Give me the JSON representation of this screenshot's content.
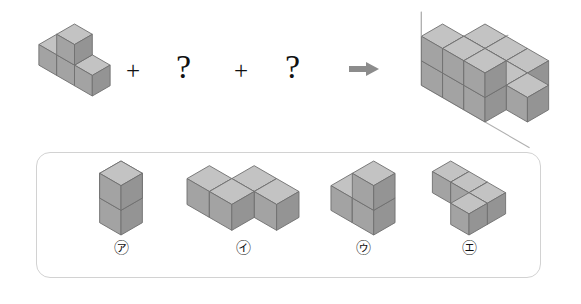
{
  "equation": {
    "operators": [
      {
        "id": "plus-1",
        "symbol": "+"
      },
      {
        "id": "question-1",
        "symbol": "?"
      },
      {
        "id": "plus-2",
        "symbol": "+"
      },
      {
        "id": "question-2",
        "symbol": "?"
      },
      {
        "id": "arrow",
        "symbol": "⇒"
      }
    ],
    "given_figure_name": "given-solid",
    "result_figure_name": "result-solid"
  },
  "options": [
    {
      "key": "ga",
      "label": "㆚e",
      "label_text": "㋐",
      "cube_count": 3,
      "shape": "L-tromino-upright"
    },
    {
      "key": "na",
      "label": "㋑",
      "label_text": "㋑",
      "cube_count": 4,
      "shape": "S-tetromino-flat"
    },
    {
      "key": "da",
      "label": "㋒",
      "label_text": "㋒",
      "cube_count": 3,
      "shape": "L-tromino-stacked"
    },
    {
      "key": "ra",
      "label": "㋓",
      "label_text": "㋓",
      "cube_count": 4,
      "shape": "L-tetromino-flat"
    }
  ],
  "option_labels": {
    "ga": "㋐",
    "na": "㋑",
    "da": "㋒",
    "ra": "㋓"
  },
  "colors": {
    "cube_top": "#c3c3c3",
    "cube_front": "#a3a3a3",
    "cube_side": "#949494",
    "cube_stroke": "#6f6f6f",
    "panel_border": "#d2d2d2",
    "arrow": "#8c8c8c",
    "axis_line": "#b0b0b0",
    "text": "#111111",
    "background": "#ffffff"
  },
  "figures": {
    "given-solid": {
      "title": "given solid",
      "cubes": [
        {
          "x": 0,
          "y": 0,
          "z": 0
        },
        {
          "x": 1,
          "y": 0,
          "z": 0
        },
        {
          "x": 2,
          "y": 0,
          "z": 0
        },
        {
          "x": 1,
          "y": 0,
          "z": 1
        }
      ]
    },
    "result-solid": {
      "title": "result solid",
      "has_axes": true,
      "cubes": [
        {
          "x": 0,
          "y": 0,
          "z": 0
        },
        {
          "x": 1,
          "y": 0,
          "z": 0
        },
        {
          "x": 2,
          "y": 0,
          "z": 0
        },
        {
          "x": 0,
          "y": 1,
          "z": 0
        },
        {
          "x": 1,
          "y": 1,
          "z": 0
        },
        {
          "x": 2,
          "y": 1,
          "z": 0
        },
        {
          "x": 3,
          "y": 1,
          "z": 0
        },
        {
          "x": 0,
          "y": 2,
          "z": 0
        },
        {
          "x": 1,
          "y": 2,
          "z": 0
        },
        {
          "x": 2,
          "y": 2,
          "z": 0
        },
        {
          "x": 0,
          "y": 2,
          "z": 1
        },
        {
          "x": 1,
          "y": 2,
          "z": 1
        },
        {
          "x": 2,
          "y": 2,
          "z": 1
        }
      ]
    },
    "option-ga": {
      "title": "option ga solid",
      "cubes": [
        {
          "x": 0,
          "y": 0,
          "z": 0
        },
        {
          "x": 1,
          "y": 1,
          "z": 0
        },
        {
          "x": 1,
          "y": 1,
          "z": 1
        }
      ]
    },
    "option-na": {
      "title": "option na solid",
      "cubes": [
        {
          "x": 1,
          "y": 0,
          "z": 0
        },
        {
          "x": 2,
          "y": 0,
          "z": 0
        },
        {
          "x": 0,
          "y": 1,
          "z": 0
        },
        {
          "x": 1,
          "y": 1,
          "z": 0
        }
      ]
    },
    "option-da": {
      "title": "option da solid",
      "cubes": [
        {
          "x": 0,
          "y": 0,
          "z": 0
        },
        {
          "x": 1,
          "y": 0,
          "z": 0
        },
        {
          "x": 1,
          "y": 0,
          "z": 1
        }
      ]
    },
    "option-ra": {
      "title": "option ra solid",
      "cubes": [
        {
          "x": 0,
          "y": 0,
          "z": 0
        },
        {
          "x": 1,
          "y": 0,
          "z": 0
        },
        {
          "x": 2,
          "y": 0,
          "z": 0
        },
        {
          "x": 2,
          "y": 1,
          "z": 0
        }
      ]
    }
  }
}
